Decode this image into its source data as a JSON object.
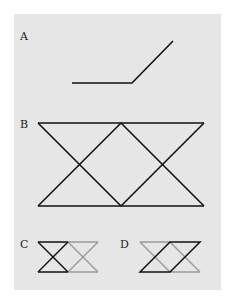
{
  "figure": {
    "background_color": "#e6e6e6",
    "line_color_primary": "#111111",
    "line_color_secondary": "#9a9a9a",
    "panels": [
      {
        "label": "A",
        "description": "Bent line: horizontal segment joined to a rising diagonal"
      },
      {
        "label": "B",
        "description": "Two overlapping bowtie (hourglass) shapes between parallel horizontal lines"
      },
      {
        "label": "C",
        "description": "Bowtie highlighted in black, adjacent bowtie in gray"
      },
      {
        "label": "D",
        "description": "Parallelogram highlighted in black within gray bowtie outline"
      }
    ]
  }
}
